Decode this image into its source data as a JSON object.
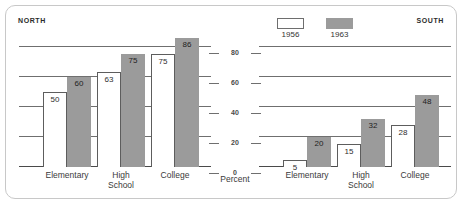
{
  "panels": {
    "north_label": "NORTH",
    "south_label": "SOUTH"
  },
  "legend": {
    "items": [
      {
        "label": "1956",
        "swatch": "legend-swatch-1956",
        "color": "#ffffff"
      },
      {
        "label": "1963",
        "swatch": "legend-swatch-1963",
        "color": "#9b9b9b"
      }
    ]
  },
  "axis": {
    "caption": "Percent",
    "ticks": [
      "80",
      "60",
      "40",
      "20",
      "0"
    ]
  },
  "categories": [
    "Elementary",
    "High\nSchool",
    "College"
  ],
  "chart_data": {
    "type": "bar",
    "title": "",
    "subtitle": "",
    "xlabel": "",
    "ylabel": "Percent",
    "ylim": [
      0,
      86.6
    ],
    "yticks": [
      0,
      20,
      40,
      60,
      80
    ],
    "grid": true,
    "legend_position": "top-center",
    "panels": [
      {
        "name": "NORTH",
        "categories": [
          "Elementary",
          "High School",
          "College"
        ],
        "series": [
          {
            "name": "1956",
            "color": "#ffffff",
            "values": [
              50,
              63,
              75
            ]
          },
          {
            "name": "1963",
            "color": "#9b9b9b",
            "values": [
              60,
              75,
              86
            ]
          }
        ]
      },
      {
        "name": "SOUTH",
        "categories": [
          "Elementary",
          "High School",
          "College"
        ],
        "series": [
          {
            "name": "1956",
            "color": "#ffffff",
            "values": [
              5,
              15,
              28
            ]
          },
          {
            "name": "1963",
            "color": "#9b9b9b",
            "values": [
              20,
              32,
              48
            ]
          }
        ]
      }
    ]
  }
}
